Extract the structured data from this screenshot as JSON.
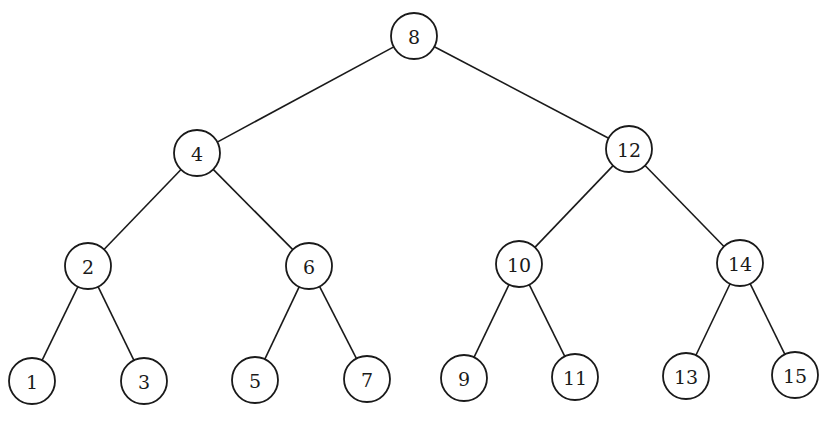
{
  "diagram": {
    "type": "binary-search-tree",
    "stroke_color": "#1a1a1a",
    "background": "#ffffff",
    "node_radius": 23,
    "nodes": [
      {
        "id": "n8",
        "label": "8",
        "x": 414,
        "y": 36
      },
      {
        "id": "n4",
        "label": "4",
        "x": 197,
        "y": 153
      },
      {
        "id": "n12",
        "label": "12",
        "x": 629,
        "y": 149
      },
      {
        "id": "n2",
        "label": "2",
        "x": 88,
        "y": 266
      },
      {
        "id": "n6",
        "label": "6",
        "x": 309,
        "y": 266
      },
      {
        "id": "n10",
        "label": "10",
        "x": 519,
        "y": 264
      },
      {
        "id": "n14",
        "label": "14",
        "x": 740,
        "y": 263
      },
      {
        "id": "n1",
        "label": "1",
        "x": 32,
        "y": 381
      },
      {
        "id": "n3",
        "label": "3",
        "x": 144,
        "y": 381
      },
      {
        "id": "n5",
        "label": "5",
        "x": 255,
        "y": 380
      },
      {
        "id": "n7",
        "label": "7",
        "x": 367,
        "y": 379
      },
      {
        "id": "n9",
        "label": "9",
        "x": 464,
        "y": 378
      },
      {
        "id": "n11",
        "label": "11",
        "x": 575,
        "y": 377
      },
      {
        "id": "n13",
        "label": "13",
        "x": 686,
        "y": 376
      },
      {
        "id": "n15",
        "label": "15",
        "x": 795,
        "y": 375
      }
    ],
    "edges": [
      [
        "n8",
        "n4"
      ],
      [
        "n8",
        "n12"
      ],
      [
        "n4",
        "n2"
      ],
      [
        "n4",
        "n6"
      ],
      [
        "n12",
        "n10"
      ],
      [
        "n12",
        "n14"
      ],
      [
        "n2",
        "n1"
      ],
      [
        "n2",
        "n3"
      ],
      [
        "n6",
        "n5"
      ],
      [
        "n6",
        "n7"
      ],
      [
        "n10",
        "n9"
      ],
      [
        "n10",
        "n11"
      ],
      [
        "n14",
        "n13"
      ],
      [
        "n14",
        "n15"
      ]
    ]
  }
}
